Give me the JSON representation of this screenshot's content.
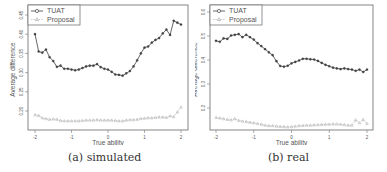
{
  "chart_data": [
    {
      "type": "line",
      "title": "",
      "caption": "(a) simulated",
      "xlabel": "True ability",
      "ylabel": "Average difference",
      "xlim": [
        -2,
        2
      ],
      "ylim": [
        0.17,
        0.46
      ],
      "xticks": [
        -2,
        -1,
        0,
        1,
        2
      ],
      "yticks": [
        0.2,
        0.25,
        0.3,
        0.35,
        0.4,
        0.45
      ],
      "ytick_labels": [
        "0.20",
        "0.25",
        "0.30",
        "0.35",
        "0.40",
        "0.45"
      ],
      "grid": false,
      "legend_position": "top-left",
      "x": [
        -2.0,
        -1.9,
        -1.8,
        -1.7,
        -1.6,
        -1.5,
        -1.4,
        -1.3,
        -1.2,
        -1.1,
        -1.0,
        -0.9,
        -0.8,
        -0.7,
        -0.6,
        -0.5,
        -0.4,
        -0.3,
        -0.2,
        -0.1,
        0.0,
        0.1,
        0.2,
        0.3,
        0.4,
        0.5,
        0.6,
        0.7,
        0.8,
        0.9,
        1.0,
        1.1,
        1.2,
        1.3,
        1.4,
        1.5,
        1.6,
        1.7,
        1.8,
        1.9,
        2.0
      ],
      "series": [
        {
          "name": "TUAT",
          "marker": "circle",
          "values": [
            0.4,
            0.355,
            0.352,
            0.36,
            0.34,
            0.33,
            0.315,
            0.318,
            0.31,
            0.31,
            0.308,
            0.306,
            0.308,
            0.312,
            0.316,
            0.318,
            0.318,
            0.322,
            0.314,
            0.31,
            0.308,
            0.302,
            0.295,
            0.294,
            0.292,
            0.298,
            0.304,
            0.316,
            0.332,
            0.35,
            0.365,
            0.368,
            0.378,
            0.385,
            0.39,
            0.402,
            0.412,
            0.398,
            0.435,
            0.43,
            0.425
          ]
        },
        {
          "name": "Proposal",
          "marker": "triangle",
          "values": [
            0.19,
            0.188,
            0.182,
            0.18,
            0.178,
            0.179,
            0.178,
            0.175,
            0.174,
            0.174,
            0.174,
            0.174,
            0.174,
            0.175,
            0.176,
            0.176,
            0.176,
            0.177,
            0.176,
            0.176,
            0.176,
            0.176,
            0.175,
            0.174,
            0.174,
            0.176,
            0.177,
            0.177,
            0.178,
            0.18,
            0.181,
            0.182,
            0.182,
            0.183,
            0.184,
            0.184,
            0.183,
            0.187,
            0.185,
            0.197,
            0.21
          ]
        }
      ]
    },
    {
      "type": "line",
      "title": "",
      "caption": "(b) real",
      "xlabel": "True ability",
      "ylabel": "Average difference",
      "xlim": [
        -2,
        2
      ],
      "ylim": [
        0.09,
        0.62
      ],
      "xticks": [
        -2,
        -1,
        0,
        1,
        2
      ],
      "yticks": [
        0.2,
        0.3,
        0.4,
        0.5,
        0.6
      ],
      "ytick_labels": [
        "0.2",
        "0.3",
        "0.4",
        "0.5",
        "0.6"
      ],
      "grid": false,
      "legend_position": "top-left",
      "x": [
        -2.0,
        -1.9,
        -1.8,
        -1.7,
        -1.6,
        -1.5,
        -1.4,
        -1.3,
        -1.2,
        -1.1,
        -1.0,
        -0.9,
        -0.8,
        -0.7,
        -0.6,
        -0.5,
        -0.4,
        -0.3,
        -0.2,
        -0.1,
        0.0,
        0.1,
        0.2,
        0.3,
        0.4,
        0.5,
        0.6,
        0.7,
        0.8,
        0.9,
        1.0,
        1.1,
        1.2,
        1.3,
        1.4,
        1.5,
        1.6,
        1.7,
        1.8,
        1.9,
        2.0
      ],
      "series": [
        {
          "name": "TUAT",
          "marker": "circle",
          "values": [
            0.48,
            0.476,
            0.49,
            0.488,
            0.502,
            0.505,
            0.508,
            0.495,
            0.505,
            0.495,
            0.485,
            0.47,
            0.458,
            0.445,
            0.432,
            0.42,
            0.395,
            0.375,
            0.372,
            0.376,
            0.386,
            0.392,
            0.398,
            0.405,
            0.405,
            0.403,
            0.402,
            0.396,
            0.388,
            0.38,
            0.374,
            0.368,
            0.365,
            0.362,
            0.365,
            0.362,
            0.36,
            0.355,
            0.36,
            0.35,
            0.36
          ]
        },
        {
          "name": "Proposal",
          "marker": "triangle",
          "values": [
            0.16,
            0.158,
            0.155,
            0.152,
            0.15,
            0.155,
            0.148,
            0.145,
            0.143,
            0.14,
            0.138,
            0.135,
            0.132,
            0.128,
            0.126,
            0.126,
            0.124,
            0.123,
            0.122,
            0.121,
            0.122,
            0.124,
            0.126,
            0.127,
            0.128,
            0.128,
            0.129,
            0.13,
            0.131,
            0.132,
            0.132,
            0.133,
            0.133,
            0.132,
            0.13,
            0.128,
            0.128,
            0.15,
            0.138,
            0.152,
            0.135
          ]
        }
      ]
    }
  ],
  "legend": {
    "tuat_label": "TUAT",
    "proposal_label": "Proposal"
  },
  "panels": [
    {
      "caption": "(a) simulated",
      "xlabel": "True ability",
      "ylabel": "Average difference"
    },
    {
      "caption": "(b) real",
      "xlabel": "True ability",
      "ylabel": "Average difference"
    }
  ]
}
